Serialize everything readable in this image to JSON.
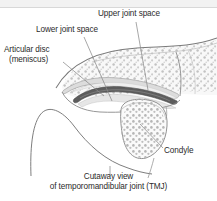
{
  "figure": {
    "title": "Cutaway view of temporomandibular joint (TMJ)",
    "background_color": "#ffffff",
    "top_strip_color": "#f2f2f2"
  },
  "labels": {
    "upper_joint_space": "Upper joint space",
    "lower_joint_space": "Lower joint space",
    "articular_disc_line1": "Articular disc",
    "articular_disc_line2": "(meniscus)",
    "condyle": "Condyle",
    "caption_line1": "Cutaway view",
    "caption_line2": "of temporomandibular joint (TMJ)"
  },
  "colors": {
    "outline": "#6e6e6e",
    "leader_line": "#8a8a8a",
    "disc_dark": "#5a5a5a",
    "bone_fill": "#f7f7f7",
    "bone_shade": "#d9d9d9",
    "cartilage": "#cfcfcf",
    "trabecular": "#b4b4b4",
    "text": "#2b2b2b"
  },
  "structures": [
    {
      "name": "temporal-bone",
      "description": "Upper temporal bone with articular eminence and trabecular stipple"
    },
    {
      "name": "articular-disc",
      "description": "Dark biconcave fibrocartilage disc between temporal bone and condyle"
    },
    {
      "name": "upper-joint-space",
      "description": "Superior joint cavity above the articular disc"
    },
    {
      "name": "lower-joint-space",
      "description": "Inferior joint cavity below the articular disc"
    },
    {
      "name": "mandibular-condyle",
      "description": "Rounded head of mandible with trabecular bone texture"
    },
    {
      "name": "coronoid-process",
      "description": "Curved anterior process of the mandibular ramus"
    },
    {
      "name": "mandibular-ramus",
      "description": "Vertical body of mandible descending at lower left"
    }
  ]
}
